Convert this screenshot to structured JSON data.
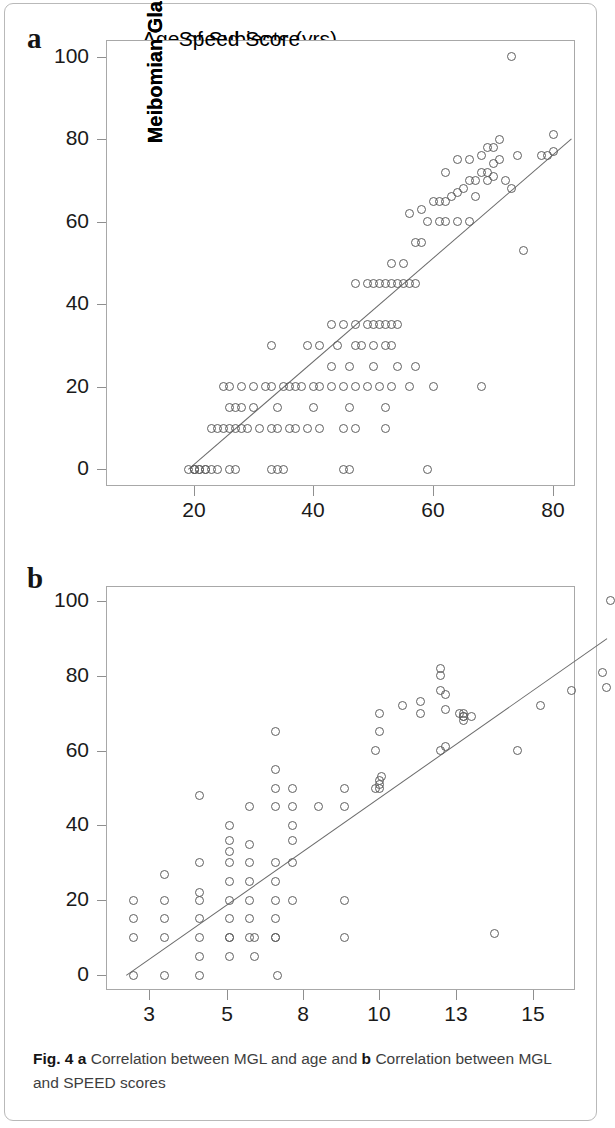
{
  "figure": {
    "caption_prefix": "Fig. 4",
    "caption_a_marker": "a",
    "caption_a_text": "Correlation between MGL and age and",
    "caption_b_marker": "b",
    "caption_b_text": "Correlation between MGL and SPEED scores",
    "panel_a_letter": "a",
    "panel_b_letter": "b"
  },
  "chart_data": [
    {
      "type": "scatter",
      "panel": "a",
      "title": "",
      "xlabel": "Age of Subjects (yrs)",
      "ylabel": "Meibomian Gland Loss [%]",
      "xlim": [
        9,
        84
      ],
      "ylim": [
        -4,
        104
      ],
      "xticks": [
        20,
        40,
        60,
        80
      ],
      "xticklabels": [
        "20",
        "40",
        "60",
        "80"
      ],
      "yticks": [
        0,
        20,
        40,
        60,
        80,
        100
      ],
      "yticklabels": [
        "0",
        "20",
        "40",
        "60",
        "80",
        "100"
      ],
      "grid": false,
      "legend": "none",
      "marker": "open-circle",
      "fit_line": {
        "x0": 19,
        "y0": 0,
        "x1": 83,
        "y1": 80
      },
      "x": [
        19,
        20,
        20,
        20,
        21,
        21,
        22,
        22,
        23,
        24,
        26,
        27,
        33,
        34,
        35,
        45,
        46,
        59,
        23,
        24,
        25,
        26,
        27,
        28,
        29,
        31,
        33,
        34,
        36,
        37,
        39,
        41,
        45,
        47,
        52,
        26,
        27,
        28,
        30,
        34,
        40,
        46,
        52,
        25,
        26,
        28,
        30,
        32,
        33,
        35,
        36,
        37,
        38,
        40,
        41,
        43,
        45,
        47,
        49,
        51,
        53,
        56,
        60,
        68,
        43,
        46,
        50,
        54,
        57,
        33,
        39,
        41,
        44,
        47,
        48,
        50,
        52,
        53,
        43,
        45,
        47,
        49,
        50,
        51,
        52,
        53,
        54,
        47,
        49,
        50,
        51,
        52,
        53,
        54,
        55,
        56,
        57,
        53,
        55,
        57,
        58,
        59,
        61,
        62,
        64,
        66,
        75,
        56,
        58,
        60,
        61,
        62,
        63,
        64,
        65,
        66,
        67,
        68,
        69,
        70,
        71,
        62,
        64,
        66,
        68,
        69,
        70,
        71,
        72,
        74,
        78,
        79,
        80,
        67,
        69,
        70,
        73,
        80,
        73
      ],
      "y": [
        0,
        0,
        0,
        0,
        0,
        0,
        0,
        0,
        0,
        0,
        0,
        0,
        0,
        0,
        0,
        0,
        0,
        0,
        10,
        10,
        10,
        10,
        10,
        10,
        10,
        10,
        10,
        10,
        10,
        10,
        10,
        10,
        10,
        10,
        10,
        15,
        15,
        15,
        15,
        15,
        15,
        15,
        15,
        20,
        20,
        20,
        20,
        20,
        20,
        20,
        20,
        20,
        20,
        20,
        20,
        20,
        20,
        20,
        20,
        20,
        20,
        20,
        20,
        20,
        25,
        25,
        25,
        25,
        25,
        30,
        30,
        30,
        30,
        30,
        30,
        30,
        30,
        30,
        35,
        35,
        35,
        35,
        35,
        35,
        35,
        35,
        35,
        45,
        45,
        45,
        45,
        45,
        45,
        45,
        45,
        45,
        45,
        50,
        50,
        55,
        55,
        60,
        60,
        60,
        60,
        60,
        53,
        62,
        63,
        65,
        65,
        65,
        66,
        67,
        68,
        70,
        70,
        72,
        72,
        74,
        75,
        72,
        75,
        75,
        76,
        78,
        78,
        80,
        70,
        76,
        76,
        76,
        81,
        66,
        70,
        71,
        68,
        77,
        100
      ]
    },
    {
      "type": "scatter",
      "panel": "b",
      "title": "",
      "xlabel": "Speed Score",
      "ylabel": "Meibomian Gland Loss [%]",
      "xlim": [
        1.6,
        17.6
      ],
      "ylim": [
        -4,
        104
      ],
      "xticks": [
        3,
        5,
        8,
        10,
        13,
        15
      ],
      "xticklabels": [
        "3",
        "5",
        "8",
        "10",
        "13",
        "15"
      ],
      "yticks": [
        0,
        20,
        40,
        60,
        80,
        100
      ],
      "yticklabels": [
        "0",
        "20",
        "40",
        "60",
        "80",
        "100"
      ],
      "grid": false,
      "legend": "none",
      "marker": "open-circle",
      "fit_line": {
        "x0": 2.4,
        "y0": 0,
        "x1": 16.9,
        "y1": 90
      },
      "x": [
        2.6,
        3.4,
        4.3,
        4.3,
        5.1,
        5.1,
        6.1,
        6.1,
        6.9,
        7.0,
        2.6,
        3.4,
        4.3,
        5.1,
        5.9,
        6.9,
        9.1,
        2.6,
        3.4,
        4.3,
        5.1,
        5.9,
        6.9,
        2.6,
        3.4,
        4.3,
        5.1,
        5.9,
        6.9,
        7.6,
        9.1,
        14.0,
        3.4,
        4.3,
        5.1,
        5.1,
        5.9,
        6.9,
        7.6,
        4.3,
        5.1,
        5.1,
        5.9,
        6.9,
        7.6,
        4.3,
        5.9,
        6.9,
        7.6,
        5.1,
        5.9,
        6.9,
        7.6,
        8.4,
        9.1,
        6.9,
        7.6,
        9.1,
        9.9,
        10.0,
        10.0,
        10.0,
        10.1,
        6.9,
        9.9,
        10.0,
        10.0,
        12.4,
        12.6,
        10.9,
        11.6,
        12.4,
        12.6,
        13.1,
        13.4,
        14.6,
        11.6,
        12.4,
        12.4,
        12.6,
        13.2,
        13.2,
        15.2,
        16.0,
        13.2,
        13.2,
        16.8,
        16.9,
        17.0
      ],
      "y": [
        0,
        0,
        0,
        5,
        5,
        10,
        10,
        5,
        10,
        0,
        10,
        10,
        10,
        10,
        10,
        10,
        10,
        15,
        15,
        15,
        15,
        15,
        15,
        20,
        20,
        20,
        20,
        20,
        20,
        20,
        20,
        11,
        27,
        22,
        25,
        30,
        25,
        25,
        30,
        48,
        33,
        36,
        30,
        30,
        36,
        30,
        35,
        45,
        40,
        40,
        45,
        55,
        45,
        45,
        45,
        50,
        50,
        50,
        50,
        50,
        51,
        52,
        53,
        65,
        60,
        65,
        70,
        60,
        61,
        72,
        70,
        76,
        75,
        70,
        69,
        60,
        73,
        80,
        82,
        71,
        69,
        70,
        72,
        76,
        68,
        69,
        81,
        77,
        100
      ]
    }
  ]
}
